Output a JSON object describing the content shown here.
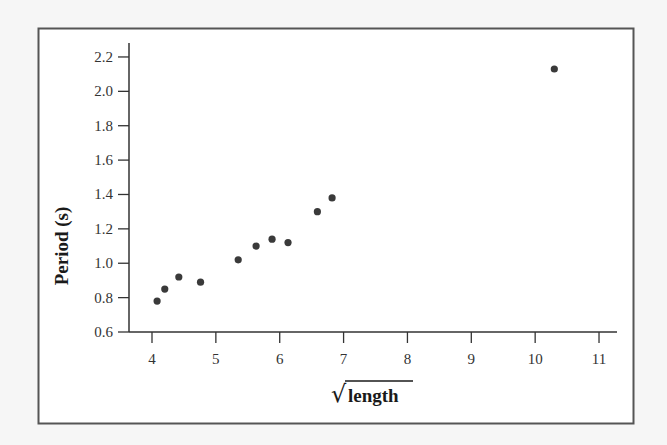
{
  "chart_data": {
    "type": "scatter",
    "title": "",
    "xlabel": "√length",
    "xlabel_parts": {
      "radical": "√",
      "text": "length"
    },
    "ylabel": "Period (s)",
    "xlim": [
      3.6,
      11.3
    ],
    "ylim": [
      0.6,
      2.3
    ],
    "xticks": [
      4,
      5,
      6,
      7,
      8,
      9,
      10,
      11
    ],
    "xtick_labels": [
      "4",
      "5",
      "6",
      "7",
      "8",
      "9",
      "10",
      "11"
    ],
    "yticks": [
      0.6,
      0.8,
      1.0,
      1.2,
      1.4,
      1.6,
      1.8,
      2.0,
      2.2
    ],
    "ytick_labels": [
      "0.6",
      "0.8",
      "1.0",
      "1.2",
      "1.4",
      "1.6",
      "1.8",
      "2.0",
      "2.2"
    ],
    "grid": false,
    "legend": null,
    "series": [
      {
        "name": "Period vs sqrt(length)",
        "color": "#3a3a3a",
        "x": [
          4.08,
          4.2,
          4.42,
          4.76,
          5.35,
          5.63,
          5.88,
          6.13,
          6.59,
          6.82,
          10.3
        ],
        "y": [
          0.78,
          0.85,
          0.92,
          0.89,
          1.02,
          1.1,
          1.14,
          1.12,
          1.3,
          1.38,
          2.13
        ]
      }
    ]
  },
  "style": {
    "background": "#f6f6f6",
    "frame_fill": "#ffffff",
    "frame_stroke": "#555555",
    "axis_color": "#333333",
    "point_color": "#3a3a3a"
  }
}
